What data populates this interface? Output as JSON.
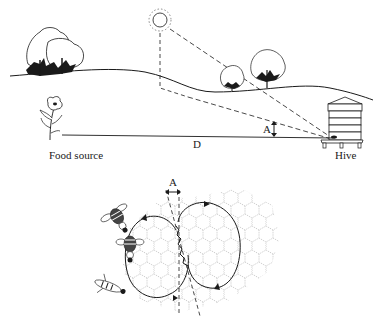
{
  "labels": {
    "food_source": "Food source",
    "hive": "Hive",
    "distance": "D",
    "angle_top": "A",
    "angle_bottom": "A"
  },
  "colors": {
    "ink": "#1a1a1a",
    "comb": "#b8b8b8",
    "background": "#ffffff"
  },
  "icons": {
    "sun": "sun-icon",
    "flower": "flower-icon",
    "hive": "beehive-icon",
    "trees": "tree-icon",
    "bees": "bee-icon"
  }
}
